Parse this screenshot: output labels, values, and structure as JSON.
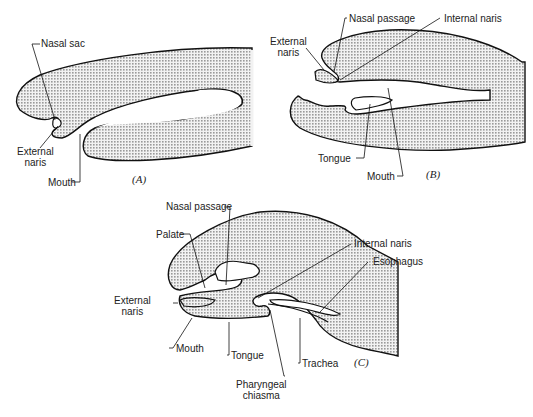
{
  "figure": {
    "panels": [
      {
        "id": "A",
        "panel_label": "(A)",
        "labels": {
          "nasal_sac": "Nasal sac",
          "external_naris": "External\nnaris",
          "mouth": "Mouth"
        }
      },
      {
        "id": "B",
        "panel_label": "(B)",
        "labels": {
          "nasal_passage": "Nasal passage",
          "internal_naris": "Internal naris",
          "external_naris": "External\nnaris",
          "tongue": "Tongue",
          "mouth": "Mouth"
        }
      },
      {
        "id": "C",
        "panel_label": "(C)",
        "labels": {
          "nasal_passage": "Nasal passage",
          "palate": "Palate",
          "internal_naris": "Internal naris",
          "esophagus": "Esophagus",
          "external_naris": "External\nnaris",
          "mouth": "Mouth",
          "tongue": "Tongue",
          "trachea": "Trachea",
          "pharyngeal_chiasma": "Pharyngeal\nchiasma"
        }
      }
    ],
    "colors": {
      "fill": "#d9d9d9",
      "stroke": "#111111",
      "stipple": "#9a9a9a"
    }
  }
}
